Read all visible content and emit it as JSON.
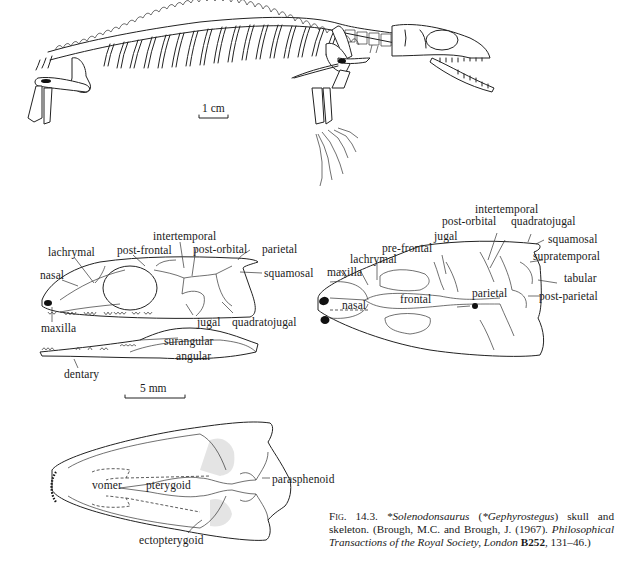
{
  "figure": {
    "skeleton": {
      "scale_bar_label": "1 cm"
    },
    "skull_lateral": {
      "labels": {
        "nasal": "nasal",
        "lachrymal": "lachrymal",
        "post_frontal": "post-frontal",
        "intertemporal": "intertemporal",
        "post_orbital": "post-orbital",
        "parietal": "parietal",
        "squamosal": "squamosal",
        "maxilla": "maxilla",
        "jugal": "jugal",
        "quadratojugal": "quadratojugal",
        "surangular": "surangular",
        "angular": "angular",
        "dentary": "dentary"
      },
      "scale_bar_label": "5 mm"
    },
    "skull_dorsal": {
      "labels": {
        "intertemporal": "intertemporal",
        "post_orbital": "post-orbital",
        "quadratojugal": "quadratojugal",
        "jugal": "jugal",
        "squamosal": "squamosal",
        "pre_frontal": "pre-frontal",
        "supratemporal": "supratemporal",
        "lachrymal": "lachrymal",
        "maxilla": "maxilla",
        "tabular": "tabular",
        "parietal": "parietal",
        "nasal": "nasal",
        "frontal": "frontal",
        "post_parietal": "post-parietal"
      }
    },
    "skull_palatal": {
      "labels": {
        "vomer": "vomer",
        "pterygoid": "pterygoid",
        "parasphenoid": "parasphenoid",
        "ectopterygoid": "ectopterygoid"
      }
    },
    "caption": {
      "fig_label": "Fig. 14.3.",
      "taxon": "*Solenodonsaurus",
      "synonym_open": " (",
      "synonym": "*Gephyrostegus",
      "desc": ") skull and skeleton. (Brough, M.C. and Brough, J. (1967). ",
      "journal": "Philosophical Transactions of the Royal Society, London",
      "volume": " B252",
      "pages": ", 131–46.)"
    }
  }
}
